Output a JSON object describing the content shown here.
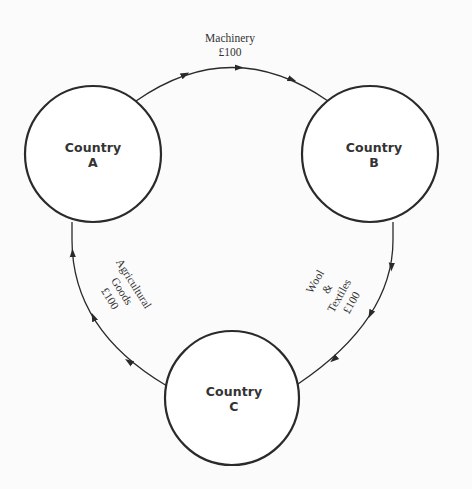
{
  "diagram": {
    "type": "circular-flow",
    "colors": {
      "background": "#fbfbfb",
      "stroke": "#2a2a2a",
      "text": "#333333"
    },
    "nodes": [
      {
        "id": "A",
        "line1": "Country",
        "line2": "A",
        "cx": 93,
        "cy": 154,
        "r": 68
      },
      {
        "id": "B",
        "line1": "Country",
        "line2": "B",
        "cx": 370,
        "cy": 154,
        "r": 68
      },
      {
        "id": "C",
        "line1": "Country",
        "line2": "C",
        "cx": 232,
        "cy": 398,
        "r": 67
      }
    ],
    "flows": [
      {
        "from": "A",
        "to": "B",
        "line1": "Machinery",
        "line2": "£100"
      },
      {
        "from": "B",
        "to": "C",
        "line1": "Wool",
        "line2": "&",
        "line3": "Textiles",
        "line4": "£100"
      },
      {
        "from": "C",
        "to": "A",
        "line1": "Agricultural",
        "line2": "Goods",
        "line3": "£100"
      }
    ]
  }
}
